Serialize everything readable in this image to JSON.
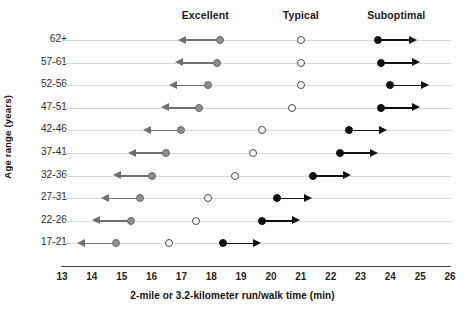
{
  "chart_data": {
    "type": "scatter",
    "title": "",
    "xlabel": "2-mile or 3.2-kilometer run/walk time (min)",
    "ylabel": "Age range (years)",
    "xlim": [
      13,
      26
    ],
    "xticks": [
      13,
      14,
      15,
      16,
      17,
      18,
      19,
      20,
      21,
      22,
      23,
      24,
      25,
      26
    ],
    "grid": false,
    "legend_position": "top",
    "categories": [
      "62+",
      "57-61",
      "52-56",
      "47-51",
      "42-46",
      "37-41",
      "32-36",
      "27-31",
      "22-26",
      "17-21"
    ],
    "column_headers": [
      "Excellent",
      "Typical",
      "Suboptimal"
    ],
    "column_header_x": [
      17.8,
      21.0,
      24.2
    ],
    "series": [
      {
        "name": "Excellent",
        "marker": "filled-grey-circle",
        "arrow": "left",
        "color": "#8e8e8e",
        "values": [
          18.3,
          18.2,
          17.9,
          17.6,
          17.0,
          16.5,
          16.0,
          15.6,
          15.3,
          14.8
        ],
        "arrow_ends": [
          16.9,
          16.8,
          16.6,
          16.3,
          15.7,
          15.2,
          14.7,
          14.3,
          14.0,
          13.5
        ]
      },
      {
        "name": "Typical",
        "marker": "open-circle",
        "arrow": "none",
        "color": "#ffffff",
        "values": [
          21.0,
          21.0,
          21.0,
          20.7,
          19.7,
          19.4,
          18.8,
          17.9,
          17.5,
          16.6
        ]
      },
      {
        "name": "Suboptimal",
        "marker": "filled-black-circle",
        "arrow": "right",
        "color": "#111111",
        "values": [
          23.6,
          23.7,
          24.0,
          23.7,
          22.6,
          22.3,
          21.4,
          20.2,
          19.7,
          18.4
        ],
        "arrow_ends": [
          24.9,
          25.0,
          25.3,
          25.0,
          23.9,
          23.6,
          22.7,
          21.4,
          21.0,
          19.7
        ]
      }
    ]
  },
  "axis": {
    "x_title": "2-mile or 3.2-kilometer run/walk time (min)",
    "y_title": "Age range (years)",
    "x_tick_labels": [
      "13",
      "14",
      "15",
      "16",
      "17",
      "18",
      "19",
      "20",
      "21",
      "22",
      "23",
      "24",
      "25",
      "26"
    ],
    "y_tick_labels": [
      "62+",
      "57-61",
      "52-56",
      "47-51",
      "42-46",
      "37-41",
      "32-36",
      "27-31",
      "22-26",
      "17-21"
    ]
  },
  "headers": {
    "excellent": "Excellent",
    "typical": "Typical",
    "suboptimal": "Suboptimal"
  },
  "colors": {
    "excellent_marker": "#8e8e8e",
    "typical_marker": "#ffffff",
    "suboptimal_marker": "#111111",
    "row_line": "#d8d8d8",
    "axis_line": "#4b4b4b"
  }
}
